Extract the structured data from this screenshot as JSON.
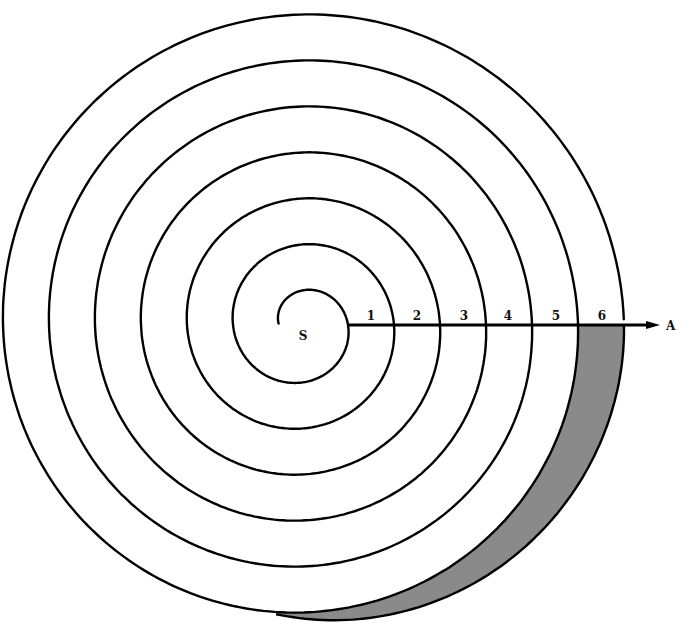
{
  "diagram": {
    "type": "archimedean-spiral",
    "center_label": "S",
    "ray_end_label": "A",
    "ray_segment_labels": [
      "1",
      "2",
      "3",
      "4",
      "5",
      "6"
    ],
    "shaded_region": "area between turn 6 and turn 7 of the spiral, below ray SA",
    "colors": {
      "stroke": "#000000",
      "shade": "#8a8a8a",
      "background": "#ffffff"
    }
  }
}
